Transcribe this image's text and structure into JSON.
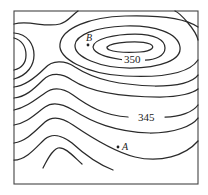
{
  "figure": {
    "type": "topographic-contour-map",
    "contour_labels": [
      {
        "text": "350",
        "x": 133,
        "y": 62
      },
      {
        "text": "345",
        "x": 150,
        "y": 122
      }
    ],
    "points": [
      {
        "name": "B",
        "label": "B",
        "x": 88,
        "y": 45
      },
      {
        "name": "A",
        "label": "A",
        "x": 118,
        "y": 147
      }
    ],
    "colors": {
      "line": "#2a2a2a",
      "frame": "#444444",
      "background": "#ffffff"
    }
  }
}
